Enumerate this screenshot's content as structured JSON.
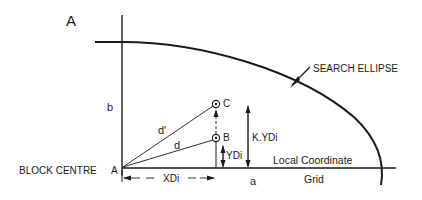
{
  "figure": {
    "panel_label": "A",
    "colors": {
      "ink": "#1a1a1a",
      "background": "#ffffff"
    }
  },
  "labels": {
    "search_ellipse": "SEARCH ELLIPSE",
    "b_axis": "b",
    "a_axis": "a",
    "block_centre": "BLOCK CENTRE",
    "point_a": "A",
    "point_b": "B",
    "point_c": "C",
    "d_prime": "d′",
    "d": "d",
    "k_ydi": "K.YDi",
    "ydi": "YDi",
    "xdi": "XDi",
    "grid_line1": "Local Coordinate",
    "grid_line2": "Grid"
  }
}
